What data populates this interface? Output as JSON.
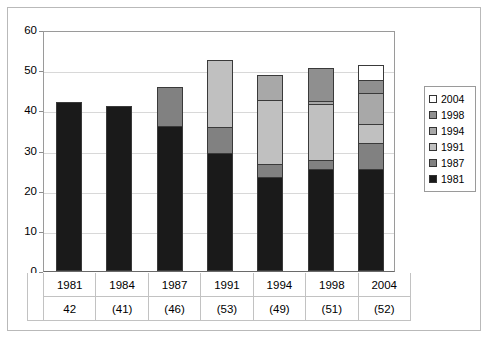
{
  "chart_data": {
    "type": "bar",
    "subtype": "stacked-bar",
    "title": "",
    "subtitle": "",
    "xlabel": "",
    "ylabel": "",
    "ylim": [
      0,
      60
    ],
    "yticks": [
      0,
      10,
      20,
      30,
      40,
      50,
      60
    ],
    "ytick_labels": [
      "0",
      "10",
      "20",
      "30",
      "40",
      "50",
      "60"
    ],
    "grid": true,
    "legend_position": "right",
    "categories": [
      "1981",
      "1984",
      "1987",
      "1991",
      "1994",
      "1998",
      "2004"
    ],
    "category_totals_labels": [
      "42",
      "(41)",
      "(46)",
      "(53)",
      "(49)",
      "(51)",
      "(52)"
    ],
    "category_totals": [
      42,
      41,
      46,
      53,
      49,
      51,
      52
    ],
    "series": [
      {
        "name": "1981",
        "color": "#1a1a1a",
        "values": [
          42,
          41,
          36,
          29.5,
          23.5,
          25.5,
          25.5
        ]
      },
      {
        "name": "1987",
        "color": "#818181",
        "values": [
          0,
          0,
          10,
          6.5,
          3.5,
          2.5,
          6.5
        ]
      },
      {
        "name": "1991",
        "color": "#c0c0c0",
        "values": [
          0,
          0,
          0,
          17,
          16,
          14,
          5
        ]
      },
      {
        "name": "1994",
        "color": "#a8a8a8",
        "values": [
          0,
          0,
          0,
          0,
          6.5,
          1,
          8
        ]
      },
      {
        "name": "1998",
        "color": "#8f8f8f",
        "values": [
          0,
          0,
          0,
          0,
          0,
          8.5,
          3.5
        ]
      },
      {
        "name": "2004",
        "color": "#ffffff",
        "values": [
          0,
          0,
          0,
          0,
          0,
          0,
          4
        ]
      }
    ],
    "legend_entries": [
      {
        "label": "2004",
        "color": "#ffffff"
      },
      {
        "label": "1998",
        "color": "#8f8f8f"
      },
      {
        "label": "1994",
        "color": "#a8a8a8"
      },
      {
        "label": "1991",
        "color": "#c0c0c0"
      },
      {
        "label": "1987",
        "color": "#818181"
      },
      {
        "label": "1981",
        "color": "#1a1a1a"
      }
    ]
  }
}
